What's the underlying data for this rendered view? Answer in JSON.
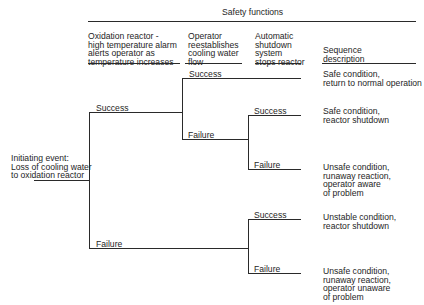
{
  "header": {
    "title": "Safety functions",
    "columns": [
      {
        "label": "Oxidation reactor -\nhigh temperature alarm\nalerts operator as\ntemperature increases"
      },
      {
        "label": "Operator\nreestablishes\ncooling water\nflow"
      },
      {
        "label": "Automatic\nshutdown\nsystem\nstops reactor"
      },
      {
        "label": "Sequence\ndescription"
      }
    ]
  },
  "initiating_event": {
    "label": "Initiating event:\nLoss of cooling water\nto oxidation reactor"
  },
  "branches": {
    "alarm_success": "Success",
    "alarm_failure": "Failure",
    "operator_success": "Success",
    "operator_failure": "Failure",
    "shutdown_success_a": "Success",
    "shutdown_failure_a": "Failure",
    "shutdown_success_b": "Success",
    "shutdown_failure_b": "Failure"
  },
  "outcomes": [
    {
      "label": "Safe condition,\nreturn to normal operation"
    },
    {
      "label": "Safe condition,\nreactor shutdown"
    },
    {
      "label": "Unsafe condition,\nrunaway reaction,\noperator aware\nof problem"
    },
    {
      "label": "Unstable condition,\nreactor shutdown"
    },
    {
      "label": "Unsafe condition,\nrunaway reaction,\noperator unaware\nof problem"
    }
  ]
}
